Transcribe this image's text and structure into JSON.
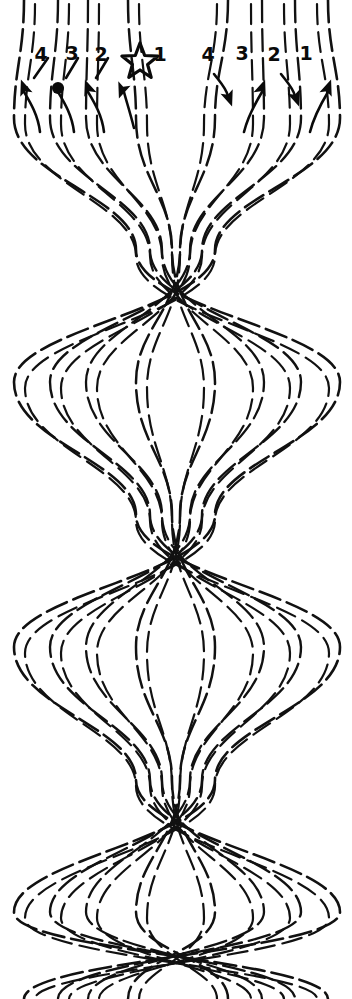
{
  "document": {
    "title": "8-Strand Braid Pattern Diagram",
    "kind": "hand-drawn braid / friendship-bracelet movement diagram",
    "background_color": "#ffffff",
    "ink_color": "#111111",
    "width": 352,
    "height": 999
  },
  "labels": {
    "left_group": [
      {
        "text": "4",
        "x": 41,
        "y": 61,
        "arrow_direction": "up-left",
        "arrowhead_style": "triangle"
      },
      {
        "text": "3",
        "x": 72,
        "y": 60,
        "arrow_direction": "up-left",
        "arrowhead_style": "blob"
      },
      {
        "text": "2",
        "x": 101,
        "y": 61,
        "arrow_direction": "up-left",
        "arrowhead_style": "triangle"
      },
      {
        "text": "1",
        "x": 160,
        "y": 61,
        "arrow_direction": "down-left",
        "arrowhead_style": "triangle"
      }
    ],
    "right_group": [
      {
        "text": "4",
        "x": 208,
        "y": 61,
        "arrow_direction": "down-right",
        "arrowhead_style": "triangle"
      },
      {
        "text": "3",
        "x": 242,
        "y": 60,
        "arrow_direction": "up-right",
        "arrowhead_style": "triangle"
      },
      {
        "text": "2",
        "x": 274,
        "y": 61,
        "arrow_direction": "down-right",
        "arrowhead_style": "triangle"
      },
      {
        "text": "1",
        "x": 306,
        "y": 60,
        "arrow_direction": "up-right",
        "arrowhead_style": "triangle"
      }
    ],
    "star_marker": {
      "icon": "star-icon",
      "center_x": 140,
      "center_y": 62,
      "outer_radius": 19,
      "inner_radius": 8,
      "belongs_to_label": "1",
      "side": "left"
    }
  },
  "strands": {
    "count": 8,
    "top_anchor_x": [
      24,
      58,
      88,
      128,
      228,
      262,
      295,
      328
    ],
    "bottom_anchor_x": [
      24,
      58,
      88,
      128,
      228,
      262,
      295,
      328
    ],
    "dash_pattern": "22 7",
    "stroke_widths": [
      2.6,
      2.4,
      2.3,
      2.5,
      2.5,
      2.3,
      2.4,
      2.6
    ]
  },
  "braid": {
    "node_centers_y": [
      250,
      515,
      780
    ],
    "bulge_centers_y": [
      118,
      382,
      647,
      912
    ],
    "node_half_height": 62,
    "bulge_outer_x": [
      14,
      50,
      86,
      136,
      215,
      264,
      301,
      340
    ],
    "node_inner_x": [
      136,
      150,
      162,
      172,
      180,
      190,
      202,
      215
    ],
    "periods": 3,
    "description": "Eight dashed strands repeatedly converge into dense diagonal lattice crossings then splay outward into lens/diamond shaped openings."
  },
  "chart_data": {
    "type": "line",
    "xlabel": "",
    "ylabel": "",
    "series": [
      {
        "name": "strand-L4",
        "label": "4",
        "side": "left",
        "start_x": 24,
        "arrow": "up-left"
      },
      {
        "name": "strand-L3",
        "label": "3",
        "side": "left",
        "start_x": 58,
        "arrow": "up-left"
      },
      {
        "name": "strand-L2",
        "label": "2",
        "side": "left",
        "start_x": 88,
        "arrow": "up-left"
      },
      {
        "name": "strand-L1",
        "label": "1",
        "side": "left",
        "start_x": 128,
        "arrow": "down-left"
      },
      {
        "name": "strand-R4",
        "label": "4",
        "side": "right",
        "start_x": 228,
        "arrow": "down-right"
      },
      {
        "name": "strand-R3",
        "label": "3",
        "side": "right",
        "start_x": 262,
        "arrow": "up-right"
      },
      {
        "name": "strand-R2",
        "label": "2",
        "side": "right",
        "start_x": 295,
        "arrow": "down-right"
      },
      {
        "name": "strand-R1",
        "label": "1",
        "side": "right",
        "start_x": 328,
        "arrow": "up-right"
      }
    ],
    "grid": false,
    "legend": "none"
  }
}
